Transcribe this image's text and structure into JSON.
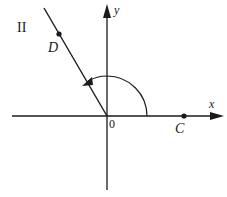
{
  "diagram": {
    "quadrant_label": "II",
    "axes": {
      "x_label": "x",
      "y_label": "y",
      "origin_label": "0"
    },
    "points": [
      {
        "name": "D",
        "label": "D"
      },
      {
        "name": "C",
        "label": "C"
      }
    ],
    "angle_arc": {
      "direction": "counterclockwise",
      "from": "positive x-axis",
      "to": "ray 0D"
    },
    "colors": {
      "ink": "#1a1a1a",
      "background": "#ffffff"
    }
  }
}
